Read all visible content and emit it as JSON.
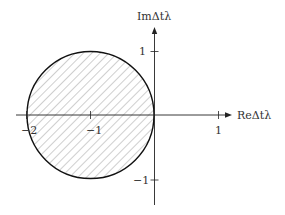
{
  "diagram": {
    "x_axis_label": "ReΔtλ",
    "y_axis_label": "ImΔtλ",
    "x_ticks": [
      {
        "value": -2,
        "label": "−2"
      },
      {
        "value": -1,
        "label": "−1"
      },
      {
        "value": 1,
        "label": "1"
      }
    ],
    "y_ticks": [
      {
        "value": 1,
        "label": "1"
      },
      {
        "value": -1,
        "label": "−1"
      }
    ],
    "region": {
      "shape": "circle",
      "center": [
        -1,
        0
      ],
      "radius": 1,
      "fill": "hatched"
    },
    "colors": {
      "axis": "#222222",
      "circle": "#111111",
      "hatch": "#888888"
    }
  }
}
